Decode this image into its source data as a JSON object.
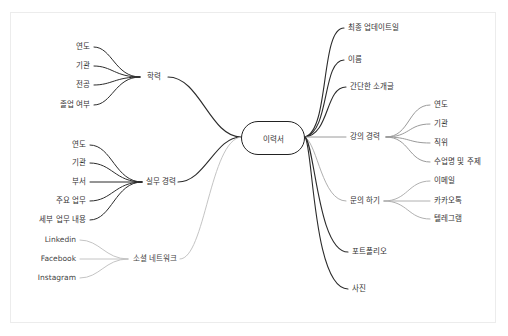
{
  "mindmap": {
    "root": "이력서",
    "colors": {
      "dark": "#2b2b2b",
      "light": "#b8b8b8",
      "frame": "#ececec"
    },
    "left": [
      {
        "label": "학력",
        "children": [
          "연도",
          "기관",
          "전공",
          "졸업 여부"
        ],
        "style": "dark"
      },
      {
        "label": "실무 경력",
        "children": [
          "연도",
          "기관",
          "부서",
          "주요 업무",
          "세부 업무 내용"
        ],
        "style": "dark"
      },
      {
        "label": "소셜 네트워크",
        "children": [
          "Linkedin",
          "Facebook",
          "Instagram"
        ],
        "style": "light"
      }
    ],
    "right": [
      {
        "label": "최종 업데이트일",
        "children": [],
        "style": "dark"
      },
      {
        "label": "이름",
        "children": [],
        "style": "dark"
      },
      {
        "label": "간단한 소개글",
        "children": [],
        "style": "dark"
      },
      {
        "label": "강의 경력",
        "children": [
          "연도",
          "기관",
          "직위",
          "수업명 및 주제"
        ],
        "style": "light"
      },
      {
        "label": "문의 하기",
        "children": [
          "이메일",
          "카카오톡",
          "텔레그램"
        ],
        "style": "light"
      },
      {
        "label": "포트폴리오",
        "children": [],
        "style": "dark"
      },
      {
        "label": "사진",
        "children": [],
        "style": "dark"
      }
    ]
  }
}
